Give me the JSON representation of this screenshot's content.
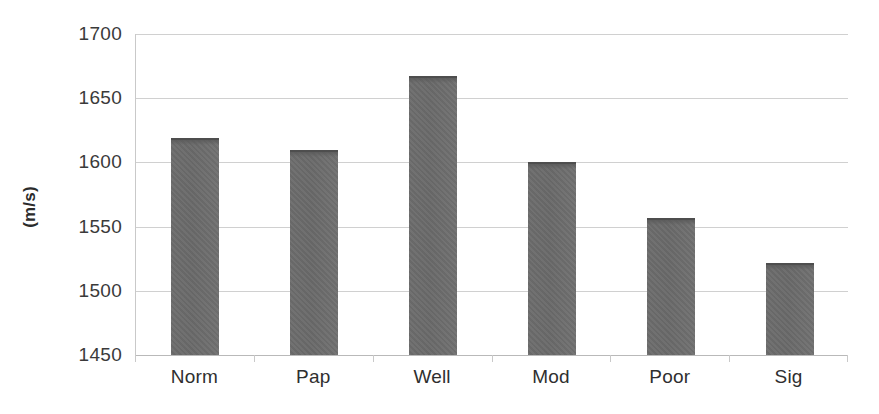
{
  "chart_data": {
    "type": "bar",
    "title": "",
    "subtitle": "",
    "xlabel": "",
    "ylabel": "(m/s)",
    "categories": [
      "Norm",
      "Pap",
      "Well",
      "Mod",
      "Poor",
      "Sig"
    ],
    "values": [
      1619,
      1610,
      1667,
      1600,
      1557,
      1522
    ],
    "series": [
      {
        "name": "Speed of sound",
        "values": [
          1619,
          1610,
          1667,
          1600,
          1557,
          1522
        ]
      }
    ],
    "ylim": [
      1450,
      1700
    ],
    "ytick_values": [
      1450,
      1500,
      1550,
      1600,
      1650,
      1700
    ],
    "ytick_labels": [
      "1450",
      "1500",
      "1550",
      "1600",
      "1650",
      "1700"
    ],
    "grid": true,
    "grid_axis": "y",
    "legend": false,
    "legend_position": "none",
    "annotations": [],
    "colors": {
      "bar_fill": "#6d6d6d",
      "bar_top_edge": "#4e4e4e",
      "gridline": "#d0d0d0",
      "axis_line": "#c9c9c9",
      "tick_label": "#3a3a3a",
      "axis_title": "#2b2b2b",
      "plot_background": "#ffffff"
    }
  },
  "axis": {
    "y_title": "(m/s)"
  }
}
